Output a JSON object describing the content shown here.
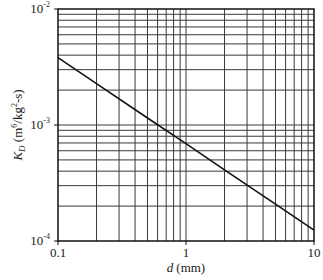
{
  "chart_data": {
    "type": "line",
    "title": "",
    "xlabel": "d (mm)",
    "xlabel_var": "d",
    "xlabel_unit": "(mm)",
    "ylabel": "K_D (m^6/kg^2-s)",
    "ylabel_var": "K",
    "ylabel_sub": "D",
    "ylabel_unit_a": " (m",
    "ylabel_unit_sup1": "6",
    "ylabel_unit_b": "/kg",
    "ylabel_unit_sup2": "2",
    "ylabel_unit_c": "-s)",
    "xscale": "log",
    "yscale": "log",
    "xlim": [
      0.1,
      10
    ],
    "ylim": [
      0.0001,
      0.01
    ],
    "grid": true,
    "x_ticks": [
      {
        "value": 0.1,
        "label": "0.1"
      },
      {
        "value": 1,
        "label": "1"
      },
      {
        "value": 10,
        "label": "10"
      }
    ],
    "y_ticks": [
      {
        "value": 0.0001,
        "base": "10",
        "exp": "-4"
      },
      {
        "value": 0.001,
        "base": "10",
        "exp": "-3"
      },
      {
        "value": 0.01,
        "base": "10",
        "exp": "-2"
      }
    ],
    "series": [
      {
        "name": "K_D",
        "x": [
          0.1,
          0.2,
          0.5,
          1,
          2,
          5,
          10
        ],
        "values": [
          0.0038,
          0.00227,
          0.00115,
          0.00069,
          0.00041,
          0.000208,
          0.000124
        ]
      }
    ]
  },
  "colors": {
    "line": "#111111",
    "grid": "#3a3a3a",
    "frame": "#111111",
    "background": "#ffffff"
  }
}
